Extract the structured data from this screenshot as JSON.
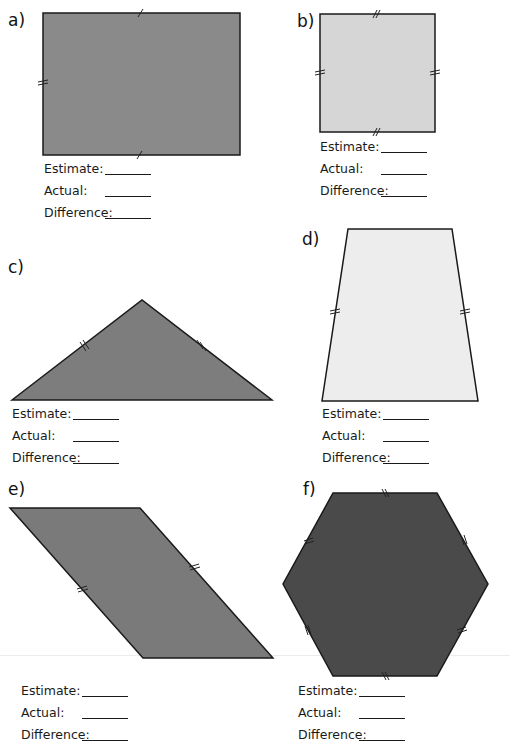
{
  "worksheet": {
    "questions": [
      {
        "id": "a",
        "label": "a)",
        "shape": "rectangle",
        "fill": "#8a8a8a",
        "answers": {
          "estimate": "Estimate:",
          "actual": "Actual:",
          "difference": "Difference:"
        }
      },
      {
        "id": "b",
        "label": "b)",
        "shape": "square",
        "fill": "#d6d6d6",
        "answers": {
          "estimate": "Estimate:",
          "actual": "Actual:",
          "difference": "Difference:"
        }
      },
      {
        "id": "c",
        "label": "c)",
        "shape": "isosceles-triangle",
        "fill": "#7d7d7d",
        "answers": {
          "estimate": "Estimate:",
          "actual": "Actual:",
          "difference": "Difference:"
        }
      },
      {
        "id": "d",
        "label": "d)",
        "shape": "isosceles-trapezium",
        "fill": "#ededed",
        "answers": {
          "estimate": "Estimate:",
          "actual": "Actual:",
          "difference": "Difference:"
        }
      },
      {
        "id": "e",
        "label": "e)",
        "shape": "parallelogram",
        "fill": "#7a7a7a",
        "answers": {
          "estimate": "Estimate:",
          "actual": "Actual:",
          "difference": "Difference:"
        }
      },
      {
        "id": "f",
        "label": "f)",
        "shape": "regular-hexagon",
        "fill": "#4a4a4a",
        "answers": {
          "estimate": "Estimate:",
          "actual": "Actual:",
          "difference": "Difference:"
        }
      }
    ]
  }
}
